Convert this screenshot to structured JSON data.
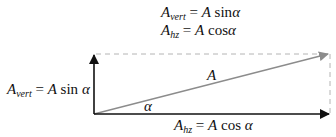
{
  "header": {
    "equation_vert": {
      "base": "A",
      "sub": "vert",
      "rhs_pre": " = ",
      "rhs_var": "A",
      "rhs_fn": " sin",
      "rhs_angle": "α"
    },
    "equation_hz": {
      "base": "A",
      "sub": "hz",
      "rhs_pre": " = ",
      "rhs_var": "A",
      "rhs_fn": " cos",
      "rhs_angle": "α"
    }
  },
  "labels": {
    "vertical_component": {
      "base": "A",
      "sub": "vert",
      "rhs_pre": " = ",
      "rhs_var": "A",
      "rhs_fn": " sin ",
      "rhs_angle": "α"
    },
    "horizontal_component": {
      "base": "A",
      "sub": "hz",
      "rhs_pre": " = ",
      "rhs_var": "A",
      "rhs_fn": " cos ",
      "rhs_angle": "α"
    },
    "vector": "A",
    "angle": "α"
  },
  "colors": {
    "component_arrows": "#111111",
    "resultant_vector": "#8c8c8c",
    "dashed_guides": "#b4b4b4"
  }
}
